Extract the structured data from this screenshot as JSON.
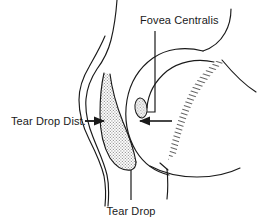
{
  "figure": {
    "title_visible": false,
    "background_color": "#ffffff",
    "line_color": "#1a1a1a",
    "stipple_color": "#9a9a9a",
    "hatch_color": "#2a2a2a",
    "width": 263,
    "height": 224
  },
  "labels": {
    "fovea_centralis": "Fovea Centralis",
    "tear_drop_dist": "Tear Drop Dist.",
    "tear_drop": "Tear Drop"
  },
  "annotations": [
    {
      "name": "fovea-centralis",
      "text": "Fovea Centralis",
      "x": 140,
      "y": 24,
      "anchor": "start",
      "leader": "vertical-then-left-to-oval"
    },
    {
      "name": "tear-drop-dist",
      "text": "Tear Drop Dist.",
      "x": 11,
      "y": 124,
      "anchor": "start",
      "leader": "horizontal-right-with-arrowhead"
    },
    {
      "name": "tear-drop",
      "text": "Tear Drop",
      "x": 131,
      "y": 215,
      "anchor": "middle",
      "leader": "vertical-up-to-teardrop-tip"
    }
  ],
  "measurement": {
    "name": "tear-drop-distance",
    "arrow_left_tip_x": 107,
    "arrow_right_tip_x": 138,
    "y": 122,
    "description": "opposing arrows spanning tear drop distance"
  },
  "regions": [
    {
      "name": "tear-drop-region",
      "fill": "stipple",
      "color": "#9a9a9a"
    },
    {
      "name": "fovea-centralis-oval",
      "fill": "stipple",
      "color": "#9a9a9a"
    },
    {
      "name": "hatched-band",
      "fill": "hatch",
      "color": "#2a2a2a"
    }
  ]
}
